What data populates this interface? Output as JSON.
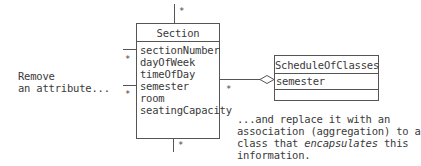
{
  "section_class": {
    "name": "Section",
    "attributes": [
      "sectionNumber",
      "dayOfWeek",
      "timeOfDay",
      "semester",
      "room",
      "seatingCapacity"
    ]
  },
  "schedule_class": {
    "name": "ScheduleOfClasses",
    "attributes": [
      "semester"
    ]
  },
  "multiplicities": {
    "top": "*",
    "bottom": "*",
    "left_upper": "*",
    "left_lower": "*",
    "aggregation": "*"
  },
  "annotations": {
    "left_line1": "Remove",
    "left_line2": "an attribute...",
    "right_line1": "...and replace it with an",
    "right_line2": "association (aggregation) to a",
    "right_line3_pre": "class that ",
    "right_line3_em": "encapsulates",
    "right_line3_post": " this",
    "right_line4": "information."
  },
  "colors": {
    "line": "#555555",
    "text": "#3a3a3a"
  }
}
